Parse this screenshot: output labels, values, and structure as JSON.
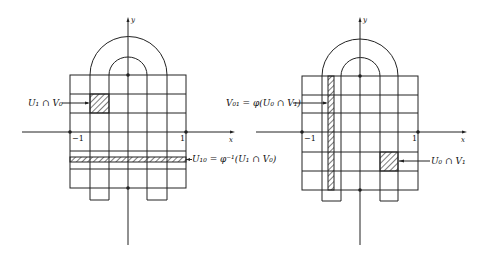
{
  "figures": [
    {
      "id": "left",
      "axis_labels": {
        "x": "x",
        "y": "y"
      },
      "ticks": {
        "neg": "−1",
        "pos": "1"
      },
      "annotations": [
        {
          "text": "U₁ ∩ V₀",
          "target": "hatched cell (second column, second row)"
        },
        {
          "text": "U₁₀ = φ⁻¹(U₁ ∩ V₀)",
          "target": "hatched horizontal strip below x-axis"
        }
      ]
    },
    {
      "id": "right",
      "axis_labels": {
        "x": "x",
        "y": "y"
      },
      "ticks": {
        "neg": "−1",
        "pos": "1"
      },
      "annotations": [
        {
          "text": "V₀₁ = φ(U₀ ∩ V₁)",
          "target": "hatched vertical strip"
        },
        {
          "text": "U₀ ∩ V₁",
          "target": "hatched cell right of y-axis below x-axis"
        }
      ]
    }
  ],
  "colors": {
    "line": "#222222",
    "background": "#ffffff"
  }
}
